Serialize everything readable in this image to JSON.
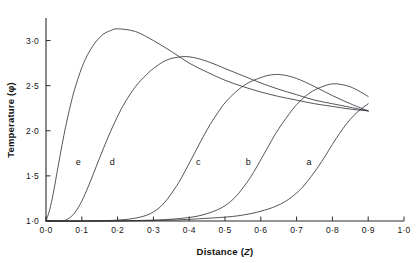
{
  "chart_data": {
    "type": "line",
    "title": "",
    "xlabel": "Distance (Z)",
    "ylabel": "Temperature (φ)",
    "xlim": [
      0.0,
      1.0
    ],
    "ylim": [
      1.0,
      3.25
    ],
    "grid": false,
    "legend_position": "inline-curve-labels",
    "xticks": [
      0.0,
      0.1,
      0.2,
      0.3,
      0.4,
      0.5,
      0.6,
      0.7,
      0.8,
      0.9,
      1.0
    ],
    "xtick_labels": [
      "0·0",
      "0·1",
      "0·2",
      "0·3",
      "0·4",
      "0·5",
      "0·6",
      "0·7",
      "0·8",
      "0·9",
      "1·0"
    ],
    "yticks": [
      1.0,
      1.5,
      2.0,
      2.5,
      3.0
    ],
    "ytick_labels": [
      "1·0",
      "1·5",
      "2·0",
      "2·5",
      "3·0"
    ],
    "series": [
      {
        "name": "e",
        "label": "e",
        "label_x": 0.09,
        "label_y": 1.62,
        "x": [
          0.0,
          0.01,
          0.02,
          0.03,
          0.04,
          0.05,
          0.06,
          0.07,
          0.08,
          0.1,
          0.12,
          0.14,
          0.16,
          0.18,
          0.2,
          0.25,
          0.3,
          0.35,
          0.4,
          0.45,
          0.5,
          0.55,
          0.6,
          0.65,
          0.7,
          0.75,
          0.8,
          0.85,
          0.9
        ],
        "y": [
          1.0,
          1.12,
          1.3,
          1.52,
          1.74,
          1.95,
          2.14,
          2.31,
          2.46,
          2.7,
          2.87,
          2.99,
          3.07,
          3.11,
          3.13,
          3.1,
          3.0,
          2.88,
          2.75,
          2.65,
          2.56,
          2.49,
          2.43,
          2.38,
          2.34,
          2.3,
          2.27,
          2.24,
          2.22
        ]
      },
      {
        "name": "d",
        "label": "d",
        "label_x": 0.185,
        "label_y": 1.62,
        "x": [
          0.0,
          0.04,
          0.06,
          0.08,
          0.1,
          0.12,
          0.14,
          0.16,
          0.18,
          0.2,
          0.22,
          0.25,
          0.28,
          0.3,
          0.33,
          0.36,
          0.4,
          0.45,
          0.5,
          0.55,
          0.6,
          0.65,
          0.7,
          0.75,
          0.8,
          0.85,
          0.9
        ],
        "y": [
          1.0,
          1.0,
          1.02,
          1.09,
          1.22,
          1.4,
          1.6,
          1.8,
          1.99,
          2.16,
          2.31,
          2.49,
          2.62,
          2.69,
          2.77,
          2.81,
          2.82,
          2.77,
          2.69,
          2.61,
          2.53,
          2.46,
          2.4,
          2.34,
          2.3,
          2.26,
          2.22
        ]
      },
      {
        "name": "c",
        "label": "c",
        "label_x": 0.425,
        "label_y": 1.62,
        "x": [
          0.0,
          0.1,
          0.2,
          0.26,
          0.3,
          0.33,
          0.36,
          0.38,
          0.4,
          0.42,
          0.44,
          0.46,
          0.48,
          0.5,
          0.53,
          0.56,
          0.6,
          0.63,
          0.66,
          0.7,
          0.75,
          0.8,
          0.85,
          0.9
        ],
        "y": [
          1.0,
          1.0,
          1.01,
          1.04,
          1.1,
          1.2,
          1.36,
          1.49,
          1.64,
          1.79,
          1.94,
          2.08,
          2.2,
          2.31,
          2.43,
          2.52,
          2.59,
          2.62,
          2.62,
          2.58,
          2.49,
          2.39,
          2.3,
          2.22
        ]
      },
      {
        "name": "b",
        "label": "b",
        "label_x": 0.565,
        "label_y": 1.62,
        "x": [
          0.0,
          0.15,
          0.3,
          0.38,
          0.43,
          0.47,
          0.5,
          0.53,
          0.56,
          0.58,
          0.6,
          0.62,
          0.64,
          0.66,
          0.68,
          0.7,
          0.73,
          0.76,
          0.8,
          0.84,
          0.87,
          0.9
        ],
        "y": [
          1.0,
          1.0,
          1.01,
          1.03,
          1.06,
          1.11,
          1.17,
          1.27,
          1.42,
          1.54,
          1.68,
          1.82,
          1.96,
          2.08,
          2.19,
          2.29,
          2.4,
          2.47,
          2.52,
          2.5,
          2.45,
          2.38
        ]
      },
      {
        "name": "a",
        "label": "a",
        "label_x": 0.735,
        "label_y": 1.62,
        "x": [
          0.0,
          0.2,
          0.35,
          0.45,
          0.52,
          0.57,
          0.61,
          0.64,
          0.67,
          0.7,
          0.72,
          0.74,
          0.76,
          0.78,
          0.8,
          0.82,
          0.84,
          0.86,
          0.88,
          0.9
        ],
        "y": [
          1.0,
          1.0,
          1.01,
          1.03,
          1.05,
          1.08,
          1.12,
          1.16,
          1.22,
          1.31,
          1.39,
          1.49,
          1.6,
          1.72,
          1.85,
          1.97,
          2.08,
          2.17,
          2.24,
          2.3
        ]
      }
    ]
  },
  "axes": {
    "x_title": "Distance (Z)",
    "x_title_main": "Distance (",
    "x_title_var": "Z",
    "x_title_close": ")",
    "y_title": "Temperature (φ)",
    "y_title_main": "Temperature (",
    "y_title_var": "φ",
    "y_title_close": ")"
  },
  "colors": {
    "curve": "#33373c",
    "axis": "#2b2b2b",
    "text": "#141414",
    "background": "#ffffff"
  }
}
